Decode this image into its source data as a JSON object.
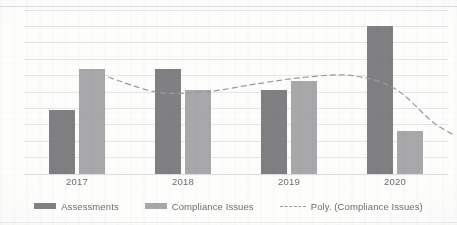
{
  "chart_data": {
    "type": "bar",
    "title": "",
    "subtitle": "",
    "xlabel": "",
    "ylabel": "",
    "categories": [
      "2017",
      "2018",
      "2019",
      "2020"
    ],
    "series": [
      {
        "name": "Assessments",
        "color": "#808083",
        "values": [
          39,
          64,
          51,
          90
        ]
      },
      {
        "name": "Compliance Issues",
        "color": "#a8a8ab",
        "values": [
          64,
          51,
          57,
          26
        ]
      }
    ],
    "trendline": {
      "name": "Poly. (Compliance Issues)",
      "style": "dashed",
      "color": "#9a9a9e",
      "of_series": "Compliance Issues",
      "points": [
        {
          "x": 0.3,
          "y": 59
        },
        {
          "x": 0.75,
          "y": 50
        },
        {
          "x": 1.2,
          "y": 50
        },
        {
          "x": 1.7,
          "y": 55
        },
        {
          "x": 2.15,
          "y": 59
        },
        {
          "x": 2.6,
          "y": 60
        },
        {
          "x": 3.0,
          "y": 52
        },
        {
          "x": 3.35,
          "y": 32
        },
        {
          "x": 3.55,
          "y": 24
        }
      ]
    },
    "ylim": [
      0,
      100
    ],
    "gridlines": [
      0,
      10,
      20,
      30,
      40,
      50,
      60,
      70,
      80,
      90,
      100
    ],
    "grid": true,
    "y_axis_visible": false,
    "legend_position": "bottom",
    "legend": [
      "Assessments",
      "Compliance Issues",
      "Poly. (Compliance Issues)"
    ]
  },
  "axis": {
    "ticks": [
      "2017",
      "2018",
      "2019",
      "2020"
    ]
  },
  "legend": {
    "items": [
      {
        "label": "Assessments",
        "marker": "swatch-dark"
      },
      {
        "label": "Compliance Issues",
        "marker": "swatch-light"
      },
      {
        "label": "Poly. (Compliance Issues)",
        "marker": "dashed-line"
      }
    ]
  },
  "colors": {
    "assessments": "#808083",
    "compliance": "#a8a8ab",
    "trendline": "#9a9a9e",
    "gridline": "#e6e6e8",
    "text": "#6d6d70",
    "background": "#fdfdfc"
  }
}
